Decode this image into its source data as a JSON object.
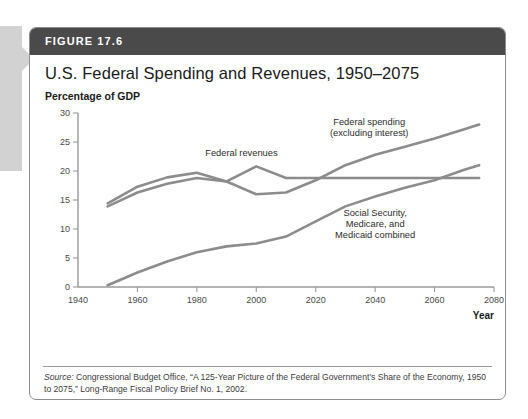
{
  "figure": {
    "header_label": "FIGURE 17.6",
    "title": "U.S. Federal Spending and Revenues, 1950–2075",
    "unit_label": "Percentage of GDP",
    "source_prefix": "Source:",
    "source_text": " Congressional Budget Office, “A 125-Year Picture of the Federal Government’s Share of the Economy, 1950 to 2075,” Long-Range Fiscal Policy Brief No. 1, 2002."
  },
  "colors": {
    "header_band": "#4a4a4a",
    "line": "#8c8c8c",
    "axis": "#9a9a9a",
    "border": "#8d8d8d",
    "tab": "#d2d2d2"
  },
  "chart_data": {
    "type": "line",
    "title": "U.S. Federal Spending and Revenues, 1950–2075",
    "xlabel": "Year",
    "ylabel": "Percentage of GDP",
    "xlim": [
      1940,
      2080
    ],
    "ylim": [
      0,
      30
    ],
    "xticks": [
      1940,
      1960,
      1980,
      2000,
      2020,
      2040,
      2060,
      2080
    ],
    "yticks": [
      0,
      5,
      10,
      15,
      20,
      25,
      30
    ],
    "grid": false,
    "legend": "inline-annotations",
    "annotations": [
      {
        "id": "spending",
        "lines": [
          "Federal spending",
          "(excluding interest)"
        ],
        "x": 2038,
        "y": 28.0
      },
      {
        "id": "revenues",
        "lines": [
          "Federal revenues"
        ],
        "x": 1995,
        "y": 22.6
      },
      {
        "id": "entitlements",
        "lines": [
          "Social Security,",
          "Medicare, and",
          "Medicaid combined"
        ],
        "x": 2040,
        "y": 12.2
      }
    ],
    "series": [
      {
        "name": "Federal spending (excluding interest)",
        "x": [
          1950,
          1960,
          1970,
          1980,
          1990,
          2000,
          2010,
          2020,
          2030,
          2040,
          2050,
          2060,
          2070,
          2075
        ],
        "values": [
          13.9,
          16.3,
          17.8,
          18.8,
          18.2,
          16.0,
          16.3,
          18.4,
          21.0,
          22.8,
          24.2,
          25.6,
          27.2,
          28.0
        ]
      },
      {
        "name": "Federal revenues",
        "x": [
          1950,
          1960,
          1970,
          1980,
          1990,
          2000,
          2010,
          2020,
          2030,
          2040,
          2050,
          2060,
          2070,
          2075
        ],
        "values": [
          14.4,
          17.3,
          18.9,
          19.7,
          18.2,
          20.8,
          18.8,
          18.8,
          18.8,
          18.8,
          18.8,
          18.8,
          18.8,
          18.8
        ]
      },
      {
        "name": "Social Security, Medicare, and Medicaid combined",
        "x": [
          1950,
          1960,
          1970,
          1980,
          1990,
          2000,
          2010,
          2020,
          2030,
          2040,
          2050,
          2060,
          2070,
          2075
        ],
        "values": [
          0.3,
          2.5,
          4.4,
          6.0,
          7.0,
          7.5,
          8.7,
          11.3,
          13.9,
          15.6,
          17.1,
          18.4,
          20.2,
          21.0
        ]
      }
    ]
  }
}
